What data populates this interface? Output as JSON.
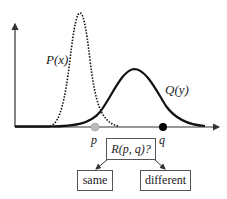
{
  "diagram": {
    "curves": [
      {
        "label": "P(x)",
        "style": "dotted",
        "color": "#111111",
        "peak_x": 80
      },
      {
        "label": "Q(y)",
        "style": "solid",
        "color": "#111111",
        "peak_x": 134
      }
    ],
    "points": [
      {
        "label": "p",
        "color": "#bbbbbb"
      },
      {
        "label": "q",
        "color": "#000000"
      }
    ],
    "question": "R(p, q)?",
    "outcomes": [
      "same",
      "different"
    ]
  }
}
